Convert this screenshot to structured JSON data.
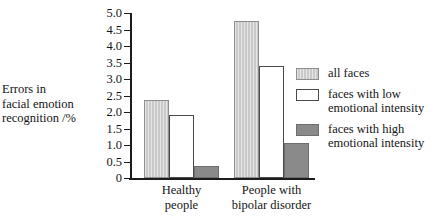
{
  "chart_data": {
    "type": "bar",
    "title": "",
    "xlabel": "",
    "ylabel": "Errors in facial emotion recognition /%",
    "ylabel_lines": [
      "Errors in",
      "facial emotion",
      "recognition /%"
    ],
    "categories": [
      "Healthy people",
      "People with bipolar disorder"
    ],
    "category_lines": [
      [
        "Healthy",
        "people"
      ],
      [
        "People with",
        "bipolar disorder"
      ]
    ],
    "series": [
      {
        "name": "all faces",
        "name_lines": [
          "all faces"
        ],
        "color": "#c9c9c9",
        "values": [
          2.35,
          4.75
        ]
      },
      {
        "name": "faces with low emotional intensity",
        "name_lines": [
          "faces with low",
          "emotional intensity"
        ],
        "color": "#ffffff",
        "values": [
          1.9,
          3.4
        ]
      },
      {
        "name": "faces with high emotional intensity",
        "name_lines": [
          "faces with high",
          "emotional intensity"
        ],
        "color": "#8a8a8a",
        "values": [
          0.35,
          1.05
        ]
      }
    ],
    "ylim": [
      0,
      5.0
    ],
    "ytick_step": 0.5,
    "ytick_labels": [
      "5.0",
      "4.5",
      "4.0",
      "3.5",
      "3.0",
      "2.5",
      "2.0",
      "1.5",
      "1.0",
      "0.5",
      "0"
    ],
    "ytick_values": [
      5.0,
      4.5,
      4.0,
      3.5,
      3.0,
      2.5,
      2.0,
      1.5,
      1.0,
      0.5,
      0
    ],
    "grid": false,
    "legend_position": "right"
  }
}
